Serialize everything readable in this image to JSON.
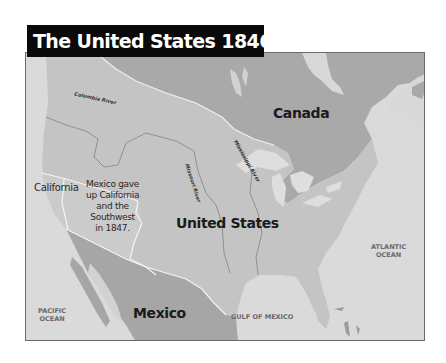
{
  "title": "The United States 1846–1848",
  "labels": {
    "canada": "Canada",
    "united_states": "United States",
    "mexico": "Mexico",
    "california": "California",
    "atlantic_ocean": [
      "ATLANTIC",
      "OCEAN"
    ],
    "pacific_ocean": [
      "PACIFIC",
      "OCEAN"
    ],
    "gulf_of_mexico": "GULF OF MEXICO",
    "note": [
      "Mexico gave",
      "up California",
      "and the",
      "Southwest",
      "in 1847."
    ]
  },
  "rivers": {
    "columbia": "Columbia River",
    "missouri": "Missouri River",
    "mississippi": "Mississippi River"
  },
  "colors": {
    "ocean": "#dadada",
    "canada": "#a9a9a9",
    "united_states": "#c4c4c4",
    "mexican_cession": "#c9c9c9",
    "mexico": "#a6a6a6",
    "title_bg": "#0a0a0a",
    "title_fg": "#ffffff"
  }
}
